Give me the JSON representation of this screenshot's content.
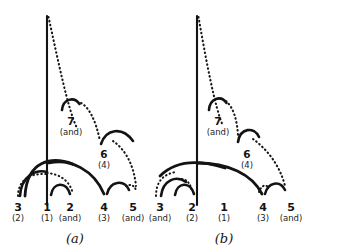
{
  "figure": {
    "background_color": "#ffffff",
    "ink_color": "#131313",
    "panels": [
      {
        "id": "a",
        "caption": "(a)",
        "barline_label": "barline",
        "beats": [
          {
            "num": "3",
            "sub": "(2)"
          },
          {
            "num": "1",
            "sub": "(1)"
          },
          {
            "num": "2",
            "sub": "(and)"
          },
          {
            "num": "4",
            "sub": "(3)"
          },
          {
            "num": "5",
            "sub": "(and)"
          }
        ],
        "upper_nodes": [
          {
            "num": "7",
            "sub": "(and)"
          },
          {
            "num": "6",
            "sub": "(4)"
          }
        ]
      },
      {
        "id": "b",
        "caption": "(b)",
        "barline_label": "barline",
        "beats": [
          {
            "num": "3",
            "sub": "(and)"
          },
          {
            "num": "2",
            "sub": "(2)"
          },
          {
            "num": "1",
            "sub": "(1)"
          },
          {
            "num": "4",
            "sub": "(3)"
          },
          {
            "num": "5",
            "sub": "(and)"
          }
        ],
        "upper_nodes": [
          {
            "num": "7",
            "sub": "(and)"
          },
          {
            "num": "6",
            "sub": "(4)"
          }
        ]
      }
    ]
  }
}
